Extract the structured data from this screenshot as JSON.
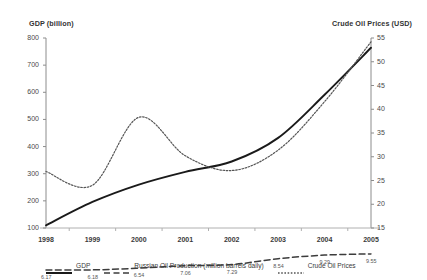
{
  "chart_data": {
    "type": "line",
    "title": "",
    "xlabel": "",
    "ylabel": "GDP (billion)",
    "y2label": "Crude Oil Prices (USD)",
    "categories": [
      "1998",
      "1999",
      "2000",
      "2001",
      "2002",
      "2003",
      "2004",
      "2005"
    ],
    "x_tick_labels": [
      "1998",
      "1999",
      "2000",
      "2001",
      "2002",
      "2003",
      "2004",
      "2005"
    ],
    "ylim": [
      100,
      800
    ],
    "y_ticks": [
      100,
      200,
      300,
      400,
      500,
      600,
      700,
      800
    ],
    "y2lim": [
      15,
      55
    ],
    "y2_ticks": [
      15,
      20,
      25,
      30,
      35,
      40,
      45,
      50,
      55
    ],
    "grid": false,
    "legend_position": "bottom",
    "series": [
      {
        "name": "GDP",
        "axis": "left",
        "style": "solid",
        "color": "#1a1a1a",
        "values": [
          110,
          196,
          260,
          307,
          345,
          432,
          591,
          764
        ]
      },
      {
        "name": "Russian Oil Production (million barrels daily)",
        "axis": "right",
        "style": "dashed",
        "color": "#3c3c3c",
        "values": [
          6.17,
          6.18,
          6.54,
          7.06,
          7.29,
          8.54,
          9.29,
          9.55
        ],
        "point_labels": [
          "6.17",
          "6.18",
          "6.54",
          "7.06",
          "7.29",
          "8.54",
          "9.29",
          "9.55"
        ]
      },
      {
        "name": "Crude Oil Prices",
        "axis": "right",
        "style": "dotted",
        "color": "#555555",
        "values": [
          26.9,
          24.0,
          38.3,
          30.2,
          27.1,
          31.4,
          41.6,
          54.2
        ]
      }
    ]
  },
  "legend": {
    "items": [
      {
        "label": "GDP",
        "style": "solid"
      },
      {
        "label": "Russian Oil Production (million barrels daily)",
        "style": "dashed"
      },
      {
        "label": "Crude Oil Prices",
        "style": "dotted"
      }
    ]
  },
  "axes": {
    "left_title": "GDP (billion)",
    "right_title": "Crude Oil Prices (USD)"
  }
}
